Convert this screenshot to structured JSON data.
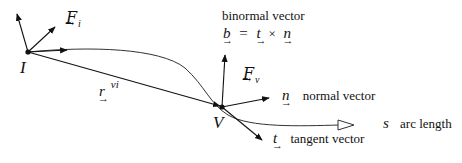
{
  "diagram": {
    "points": {
      "I": {
        "label": "I",
        "x": 28,
        "y": 52
      },
      "V": {
        "label": "V",
        "x": 222,
        "y": 107
      }
    },
    "labels": {
      "F_i": {
        "symbol": "F",
        "subscript": "i"
      },
      "F_v": {
        "symbol": "F",
        "subscript": "v"
      },
      "r_vi": {
        "symbol": "r",
        "superscript": "vi"
      },
      "binormal_title": "binormal vector",
      "binormal_eq": {
        "b": "b",
        "eq": "=",
        "t": "t",
        "times": "×",
        "n": "n"
      },
      "normal": {
        "symbol": "n",
        "text": "normal vector"
      },
      "tangent": {
        "symbol": "t",
        "text": "tangent vector"
      },
      "arc": {
        "symbol": "s",
        "text": "arc length"
      }
    }
  }
}
